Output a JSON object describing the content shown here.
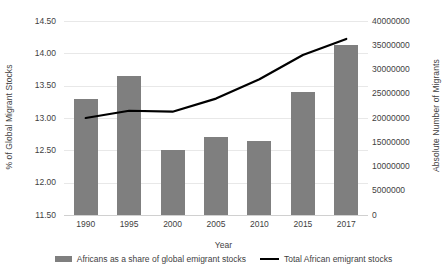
{
  "chart_data": {
    "type": "bar",
    "title": "",
    "xlabel": "Year",
    "categories": [
      "1990",
      "1995",
      "2000",
      "2005",
      "2010",
      "2015",
      "2017"
    ],
    "grid": true,
    "legend_position": "bottom",
    "axes": {
      "left": {
        "label": "% of Global Migrant Stocks",
        "ticks": [
          "11.50",
          "12.00",
          "12.50",
          "13.00",
          "13.50",
          "14.00",
          "14.50"
        ],
        "min": 11.5,
        "max": 14.5,
        "step": 0.5
      },
      "right": {
        "label": "Absolute Number of Migrants",
        "ticks": [
          "0",
          "5000000",
          "10000000",
          "15000000",
          "20000000",
          "25000000",
          "30000000",
          "35000000",
          "40000000"
        ],
        "min": 0,
        "max": 40000000,
        "step": 5000000
      }
    },
    "series": [
      {
        "name": "Africans as a share of global emigrant stocks",
        "type": "bar",
        "axis": "left",
        "color": "#7f7f7f",
        "values": [
          13.3,
          13.65,
          12.5,
          12.7,
          12.65,
          13.41,
          14.13
        ]
      },
      {
        "name": "Total African emigrant stocks",
        "type": "line",
        "axis": "right",
        "color": "#000000",
        "values": [
          20000000,
          21500000,
          21300000,
          24000000,
          28000000,
          33000000,
          36300000
        ]
      }
    ]
  },
  "legend": {
    "items": [
      {
        "label": "Africans as a share of global emigrant stocks",
        "marker": "bar-swatch"
      },
      {
        "label": "Total African emigrant stocks",
        "marker": "line-swatch"
      }
    ]
  }
}
